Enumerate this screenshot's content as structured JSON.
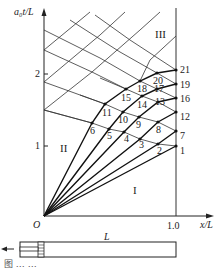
{
  "diagram": {
    "y_axis_label": "a₀t/L",
    "x_axis_label": "x/L",
    "origin_label": "O",
    "y_ticks": [
      {
        "label": "1",
        "value": 1
      },
      {
        "label": "2",
        "value": 2
      }
    ],
    "x_ticks": [
      {
        "label": "1.0",
        "value": 1.0
      }
    ],
    "regions": [
      {
        "label": "I"
      },
      {
        "label": "II"
      },
      {
        "label": "III"
      }
    ],
    "nodes": [
      "1",
      "2",
      "3",
      "4",
      "5",
      "6",
      "7",
      "8",
      "9",
      "10",
      "11",
      "12",
      "13",
      "14",
      "15",
      "16",
      "17",
      "18",
      "19",
      "20",
      "21"
    ],
    "tube_length_label": "L",
    "piston_direction": "left-arrow",
    "caption": "图 … …"
  }
}
